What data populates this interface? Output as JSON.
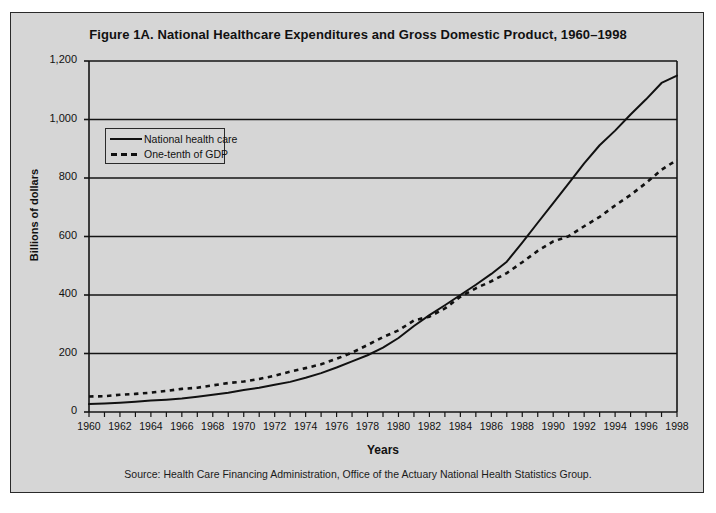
{
  "figure": {
    "title": "Figure 1A. National Healthcare Expenditures and Gross Domestic Product, 1960–1998",
    "source": "Source: Health Care Financing Administration, Office of the Actuary National Health Statistics Group."
  },
  "chart_data": {
    "type": "line",
    "title": "Figure 1A. National Healthcare Expenditures and Gross Domestic Product, 1960–1998",
    "xlabel": "Years",
    "ylabel": "Billions of dollars",
    "xlim": [
      1960,
      1998
    ],
    "ylim": [
      0,
      1200
    ],
    "ytick_labels": [
      "0",
      "200",
      "400",
      "600",
      "800",
      "1,000",
      "1,200"
    ],
    "yticks": [
      0,
      200,
      400,
      600,
      800,
      1000,
      1200
    ],
    "xtick_labels": [
      "1960",
      "1962",
      "1964",
      "1966",
      "1968",
      "1970",
      "1972",
      "1974",
      "1976",
      "1978",
      "1980",
      "1982",
      "1984",
      "1986",
      "1988",
      "1990",
      "1992",
      "1994",
      "1996",
      "1998"
    ],
    "xticks": [
      1960,
      1962,
      1964,
      1966,
      1968,
      1970,
      1972,
      1974,
      1976,
      1978,
      1980,
      1982,
      1984,
      1986,
      1988,
      1990,
      1992,
      1994,
      1996,
      1998
    ],
    "minor_xtick_interval": 1,
    "grid": "horizontal",
    "legend_position": "upper left",
    "x": [
      1960,
      1961,
      1962,
      1963,
      1964,
      1965,
      1966,
      1967,
      1968,
      1969,
      1970,
      1971,
      1972,
      1973,
      1974,
      1975,
      1976,
      1977,
      1978,
      1979,
      1980,
      1981,
      1982,
      1983,
      1984,
      1985,
      1986,
      1987,
      1988,
      1989,
      1990,
      1991,
      1992,
      1993,
      1994,
      1995,
      1996,
      1997,
      1998
    ],
    "series": [
      {
        "name": "National health care",
        "style": "solid",
        "color": "#111111",
        "values": [
          27,
          29,
          32,
          35,
          39,
          42,
          46,
          52,
          59,
          66,
          75,
          83,
          93,
          103,
          117,
          133,
          152,
          173,
          194,
          220,
          253,
          294,
          331,
          365,
          400,
          435,
          472,
          514,
          579,
          647,
          714,
          782,
          850,
          912,
          962,
          1017,
          1069,
          1125,
          1150
        ]
      },
      {
        "name": "One-tenth of GDP",
        "style": "dashed",
        "color": "#111111",
        "values": [
          53,
          54,
          59,
          62,
          66,
          72,
          79,
          83,
          91,
          99,
          104,
          113,
          124,
          138,
          150,
          163,
          182,
          203,
          229,
          256,
          279,
          313,
          326,
          354,
          394,
          423,
          447,
          475,
          512,
          551,
          583,
          601,
          635,
          667,
          706,
          742,
          783,
          828,
          862
        ]
      }
    ]
  }
}
